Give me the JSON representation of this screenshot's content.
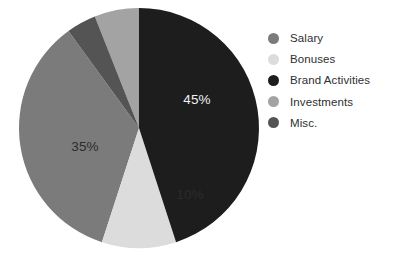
{
  "chart_data": {
    "type": "pie",
    "title": "",
    "subtitle": "",
    "xlabel": "",
    "ylabel": "",
    "grid": false,
    "legend_position": "right",
    "start_angle_deg": 0,
    "direction": "clockwise",
    "center": {
      "x": 139,
      "y": 128
    },
    "radius": 120,
    "categories": [
      "Salary",
      "Bonuses",
      "Brand Activities",
      "Investments",
      "Misc."
    ],
    "values": [
      35,
      10,
      45,
      6,
      4
    ],
    "unit": "%",
    "slices": [
      {
        "name": "Salary",
        "value": 35,
        "label": "35%",
        "label_shown": true,
        "label_color": "#2b2b2b",
        "color": "#7b7b7b",
        "start_deg": 198,
        "end_deg": 324,
        "label_x": 85,
        "label_y": 151
      },
      {
        "name": "Bonuses",
        "value": 10,
        "label": "10%",
        "label_shown": true,
        "label_color": "#2b2b2b",
        "color": "#dcdcdc",
        "start_deg": 162,
        "end_deg": 198,
        "label_x": 190,
        "label_y": 199
      },
      {
        "name": "Brand Activities",
        "value": 45,
        "label": "45%",
        "label_shown": true,
        "label_color": "#f2f2f2",
        "color": "#1d1d1d",
        "start_deg": 0,
        "end_deg": 162,
        "label_x": 197,
        "label_y": 104
      },
      {
        "name": "Investments",
        "value": 6,
        "label": "",
        "label_shown": false,
        "label_color": "#2b2b2b",
        "color": "#a3a3a3",
        "start_deg": 338.4,
        "end_deg": 360,
        "label_x": 0,
        "label_y": 0
      },
      {
        "name": "Misc.",
        "value": 4,
        "label": "",
        "label_shown": false,
        "label_color": "#f2f2f2",
        "color": "#545454",
        "start_deg": 324,
        "end_deg": 338.4,
        "label_x": 0,
        "label_y": 0
      }
    ]
  },
  "legend": {
    "items": [
      {
        "label": "Salary",
        "color": "#7b7b7b"
      },
      {
        "label": "Bonuses",
        "color": "#dcdcdc"
      },
      {
        "label": "Brand Activities",
        "color": "#1d1d1d"
      },
      {
        "label": "Investments",
        "color": "#a3a3a3"
      },
      {
        "label": "Misc.",
        "color": "#545454"
      }
    ]
  },
  "colors": {
    "background": "#ffffff",
    "salary": "#7b7b7b",
    "bonuses": "#dcdcdc",
    "brand_activities": "#1d1d1d",
    "investments": "#a3a3a3",
    "misc": "#545454",
    "legend_text": "#2f2f2f"
  }
}
